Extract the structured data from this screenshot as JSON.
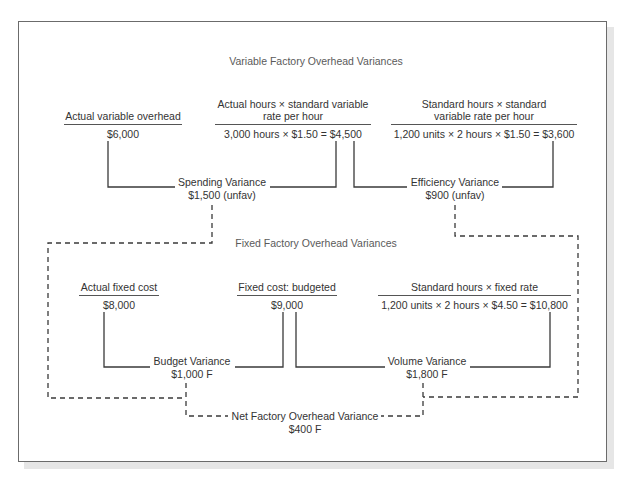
{
  "diagram": {
    "variable_section": {
      "title": "Variable Factory Overhead Variances",
      "columns": [
        {
          "heading": "Actual variable overhead",
          "value": "$6,000"
        },
        {
          "heading_line1": "Actual hours × standard variable",
          "heading_line2": "rate per hour",
          "value": "3,000 hours × $1.50 = $4,500"
        },
        {
          "heading_line1": "Standard hours × standard",
          "heading_line2": "variable rate per hour",
          "value": "1,200 units × 2 hours × $1.50 = $3,600"
        }
      ],
      "variances": [
        {
          "label": "Spending Variance",
          "amount": "$1,500 (unfav)"
        },
        {
          "label": "Efficiency Variance",
          "amount": "$900 (unfav)"
        }
      ]
    },
    "fixed_section": {
      "title": "Fixed Factory Overhead Variances",
      "columns": [
        {
          "heading": "Actual fixed cost",
          "value": "$8,000"
        },
        {
          "heading": "Fixed cost: budgeted",
          "value": "$9,000"
        },
        {
          "heading": "Standard hours × fixed rate",
          "value": "1,200 units × 2 hours × $4.50 = $10,800"
        }
      ],
      "variances": [
        {
          "label": "Budget Variance",
          "amount": "$1,000 F"
        },
        {
          "label": "Volume Variance",
          "amount": "$1,800 F"
        }
      ]
    },
    "net": {
      "label": "Net Factory Overhead Variance",
      "amount": "$400 F"
    },
    "colors": {
      "line": "#3a3a3a",
      "frame": "#6b6b6b",
      "shadow": "#e6e6e6",
      "text": "#333333",
      "title_text": "#5a5a5a"
    }
  }
}
